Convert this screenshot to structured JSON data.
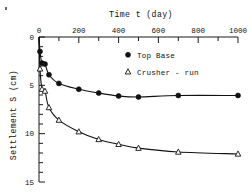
{
  "chart_data": {
    "type": "line",
    "title": "Time t (day)",
    "xlabel": "Time t (day)",
    "ylabel": "Settlement S (cm)",
    "xlim": [
      0,
      1000
    ],
    "ylim": [
      0,
      15
    ],
    "y_axis_inverted": true,
    "grid": false,
    "x_ticks": [
      0,
      200,
      400,
      600,
      800,
      1000
    ],
    "x_tick_labels": [
      "0",
      "200",
      "400",
      "600",
      "800",
      "1000"
    ],
    "x_minor_tick_interval": 100,
    "y_ticks": [
      0,
      5,
      10,
      15
    ],
    "y_tick_labels": [
      "0",
      "5",
      "10",
      "15"
    ],
    "y_minor_tick_interval": 1,
    "legend_position": "upper-right-inside",
    "series": [
      {
        "name": "Top Base",
        "marker": "filled-circle",
        "x": [
          0,
          5,
          15,
          30,
          50,
          100,
          200,
          300,
          400,
          500,
          700,
          1000
        ],
        "values": [
          0.0,
          1.5,
          2.7,
          2.8,
          3.9,
          4.8,
          5.4,
          5.8,
          6.1,
          6.2,
          6.05,
          6.05
        ]
      },
      {
        "name": "Crusher - run",
        "marker": "open-triangle",
        "x": [
          0,
          5,
          15,
          30,
          50,
          100,
          200,
          300,
          400,
          500,
          700,
          1000
        ],
        "values": [
          0.0,
          3.3,
          5.4,
          5.6,
          7.3,
          8.6,
          9.8,
          10.6,
          11.1,
          11.5,
          11.9,
          12.1
        ]
      }
    ],
    "legend": [
      {
        "label": "Top Base",
        "marker": "filled-circle"
      },
      {
        "label": "Crusher - run",
        "marker": "open-triangle"
      }
    ]
  }
}
